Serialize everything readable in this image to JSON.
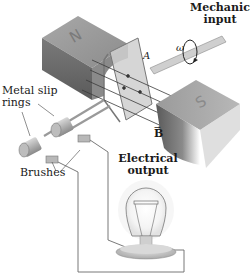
{
  "diagram": {
    "type": "physics-illustration",
    "labels": {
      "mechanical_input_line1": "Mechanical",
      "mechanical_input_line2": "input",
      "omega": "ω",
      "loop_area": "A",
      "magnetic_field": "B",
      "north_pole": "N",
      "south_pole": "S",
      "slip_rings_line1": "Metal slip",
      "slip_rings_line2": "rings",
      "brushes": "Brushes",
      "electrical_output_line1": "Electrical",
      "electrical_output_line2": "output"
    },
    "colors": {
      "magnet_top": "#9a9a9a",
      "magnet_side": "#6e6e6e",
      "magnet_face": "#b5b5b5",
      "coil": "#c8c8c8",
      "wire": "#6a6a6a",
      "field_line": "#3a3a3a",
      "text": "#1a1a1a"
    }
  }
}
